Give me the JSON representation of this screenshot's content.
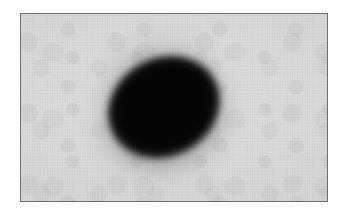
{
  "figure": {
    "kind": "grayscale-scan-image",
    "caption": "",
    "canvas": {
      "width_px": 348,
      "height_px": 216
    },
    "paper": {
      "background_color": "#fdfdfd"
    }
  },
  "frame": {
    "name": "scan-plate-border",
    "left_px": 20,
    "top_px": 13,
    "width_px": 308,
    "height_px": 189,
    "border_color": "#6d6d6d",
    "border_width_px": 1.5,
    "plate_background_color": "#d9d9d9",
    "plate_background_range": [
      "#cfcfcf",
      "#dedede"
    ]
  },
  "texture": {
    "name": "film-grain",
    "description": "fine vertical scan-line striping with mottled film grain",
    "visible": true
  },
  "blob": {
    "name": "dark-elliptical-region",
    "description": "dense black ellipse with diffuse gray halo, major axis tilted from lower-left to upper-right",
    "core_color": "#050505",
    "halo_color": "#4a4a4a",
    "rotation_deg": -28,
    "center_px": {
      "x": 163,
      "y": 106
    },
    "bounds_px": {
      "left": 106,
      "top": 48,
      "right": 220,
      "bottom": 164
    },
    "core_width_px": 122,
    "core_height_px": 104,
    "halo_width_px": 150,
    "halo_height_px": 148,
    "edge_softness": "soft gradient, widest toward lower-left and bottom"
  },
  "chart_data": {
    "type": "heatmap",
    "xlabel": "",
    "ylabel": "",
    "grid": false,
    "legend": "none",
    "colormap": "grayscale",
    "value_range": [
      0,
      255
    ],
    "background_value": 215,
    "peak_value": 5,
    "peak_location_px": {
      "x": 163,
      "y": 106
    },
    "annotations": [],
    "tick_labels": {
      "x": [],
      "y": []
    }
  }
}
